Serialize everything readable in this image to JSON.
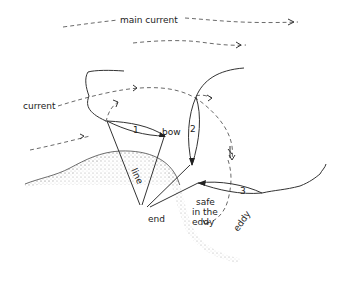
{
  "labels": {
    "main_current": "main current",
    "current": "current",
    "bow": "bow",
    "line": "line",
    "end": "end",
    "safe_line1": "safe",
    "safe_line2": "in the",
    "safe_line3": "eddy",
    "eddy": "eddy"
  },
  "boat_positions": [
    "1",
    "2",
    "3"
  ],
  "colors": {
    "ink": "#333333",
    "background": "#ffffff",
    "stipple": "#999999"
  }
}
